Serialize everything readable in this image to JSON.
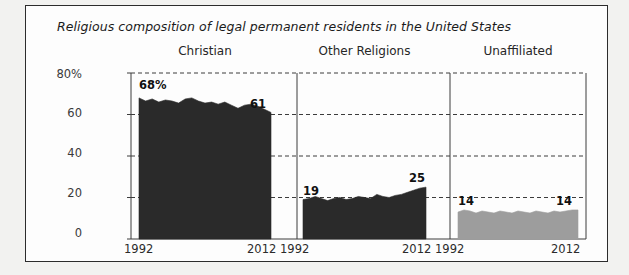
{
  "figure": {
    "title": "Religious composition of legal permanent residents in the United States",
    "background_color": "#fdfdfd",
    "border_color": "#2c2c2c",
    "outside_color": "#f2f2f0"
  },
  "axis": {
    "y_ticks": [
      "80%",
      "60",
      "40",
      "20",
      "0"
    ],
    "y_values": [
      80,
      60,
      40,
      20,
      0
    ],
    "x_ticks": [
      "1992",
      "2012"
    ],
    "gridlines": "dashed"
  },
  "panels": [
    {
      "label": "Christian",
      "start_label": "68%",
      "end_label": "61",
      "color": "#2a2a2a",
      "x_start": "1992",
      "x_end": "2012"
    },
    {
      "label": "Other Religions",
      "start_label": "19",
      "end_label": "25",
      "color": "#2a2a2a",
      "x_start": "1992",
      "x_end": "2012"
    },
    {
      "label": "Unaffiliated",
      "start_label": "14",
      "end_label": "14",
      "color": "#9d9d9d",
      "x_start": "1992",
      "x_end": "2012"
    }
  ],
  "chart_data": {
    "type": "area",
    "title": "Religious composition of legal permanent residents in the United States",
    "xlabel": "",
    "ylabel": "",
    "ylim": [
      0,
      80
    ],
    "xlim": [
      1992,
      2012
    ],
    "grid": true,
    "legend": "none",
    "y_tick_labels": [
      "80%",
      "60",
      "40",
      "20",
      "0"
    ],
    "x_tick_labels": [
      "1992",
      "2012"
    ],
    "panels": [
      {
        "name": "Christian",
        "color": "#2a2a2a",
        "annotations": {
          "start": "68%",
          "end": "61"
        },
        "x": [
          1992,
          1993,
          1994,
          1995,
          1996,
          1997,
          1998,
          1999,
          2000,
          2001,
          2002,
          2003,
          2004,
          2005,
          2006,
          2007,
          2008,
          2009,
          2010,
          2011,
          2012
        ],
        "values": [
          68,
          66.5,
          67.5,
          66,
          67,
          66.5,
          65.5,
          67.5,
          68,
          66.5,
          65.5,
          66,
          65,
          66,
          64.5,
          63,
          64.5,
          65,
          64,
          62.5,
          61
        ]
      },
      {
        "name": "Other Religions",
        "color": "#2a2a2a",
        "annotations": {
          "start": "19",
          "end": "25"
        },
        "x": [
          1992,
          1993,
          1994,
          1995,
          1996,
          1997,
          1998,
          1999,
          2000,
          2001,
          2002,
          2003,
          2004,
          2005,
          2006,
          2007,
          2008,
          2009,
          2010,
          2011,
          2012
        ],
        "values": [
          19,
          19.5,
          20.5,
          19.5,
          18.5,
          19.5,
          20,
          19,
          19.5,
          20.5,
          20,
          19.5,
          21.5,
          20.5,
          20,
          21,
          21.5,
          22.5,
          23.5,
          24.5,
          25
        ]
      },
      {
        "name": "Unaffiliated",
        "color": "#9d9d9d",
        "annotations": {
          "start": "14",
          "end": "14"
        },
        "x": [
          1992,
          1993,
          1994,
          1995,
          1996,
          1997,
          1998,
          1999,
          2000,
          2001,
          2002,
          2003,
          2004,
          2005,
          2006,
          2007,
          2008,
          2009,
          2010,
          2011,
          2012
        ],
        "values": [
          13,
          14,
          13.5,
          12.5,
          13.5,
          13,
          12.5,
          13.5,
          13,
          12.5,
          13.5,
          13,
          12.5,
          13.5,
          13,
          12.5,
          13.5,
          13,
          13.5,
          14,
          14
        ]
      }
    ]
  }
}
